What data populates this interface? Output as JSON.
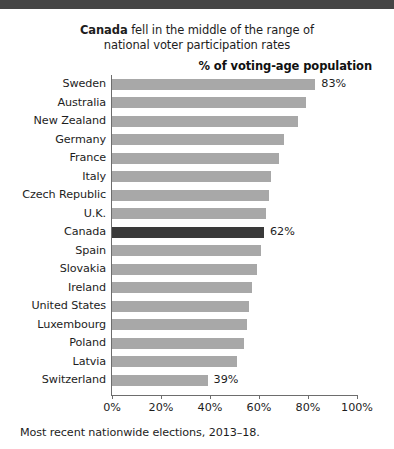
{
  "topbar": {
    "color": "#454545"
  },
  "chart_data": {
    "type": "bar",
    "orientation": "horizontal",
    "title_line1_prefix": "Canada",
    "title_line1_rest": " fell in the middle of the range of",
    "title_line2": "national voter participation rates",
    "axis_title": "% of voting-age population",
    "xlabel": "",
    "ylabel": "",
    "xlim": [
      0,
      100
    ],
    "xticks": [
      0,
      20,
      40,
      60,
      80,
      100
    ],
    "xticklabels": [
      "0%",
      "20%",
      "40%",
      "60%",
      "80%",
      "100%"
    ],
    "grid": false,
    "legend": "none",
    "bar_color": "#a8a8a8",
    "highlight_color": "#3a3a3a",
    "highlight_category": "Canada",
    "categories": [
      "Sweden",
      "Australia",
      "New Zealand",
      "Germany",
      "France",
      "Italy",
      "Czech Republic",
      "U.K.",
      "Canada",
      "Spain",
      "Slovakia",
      "Ireland",
      "United States",
      "Luxembourg",
      "Poland",
      "Latvia",
      "Switzerland"
    ],
    "values": [
      83,
      79,
      76,
      70,
      68,
      65,
      64,
      63,
      62,
      61,
      59,
      57,
      56,
      55,
      54,
      51,
      39
    ],
    "labels": [
      {
        "category": "Sweden",
        "value": 83,
        "text": "83%"
      },
      {
        "category": "Canada",
        "value": 62,
        "text": "62%"
      },
      {
        "category": "Switzerland",
        "value": 39,
        "text": "39%"
      }
    ],
    "footnote": "Most recent nationwide elections, 2013–18."
  }
}
